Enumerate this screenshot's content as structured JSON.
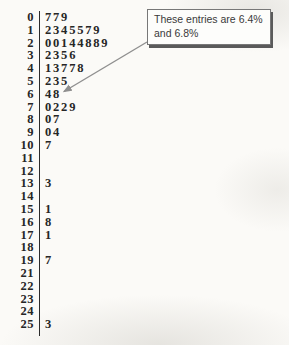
{
  "chart_data": {
    "type": "table",
    "subtype": "stem-and-leaf-plot",
    "title": "",
    "columns": [
      "stem",
      "leaves"
    ],
    "rows": [
      {
        "stem": "0",
        "leaf": "779"
      },
      {
        "stem": "1",
        "leaf": "2345579"
      },
      {
        "stem": "2",
        "leaf": "00144889"
      },
      {
        "stem": "3",
        "leaf": "2356"
      },
      {
        "stem": "4",
        "leaf": "13778"
      },
      {
        "stem": "5",
        "leaf": "235"
      },
      {
        "stem": "6",
        "leaf": "48"
      },
      {
        "stem": "7",
        "leaf": "0229"
      },
      {
        "stem": "8",
        "leaf": "07"
      },
      {
        "stem": "9",
        "leaf": "04"
      },
      {
        "stem": "10",
        "leaf": "7"
      },
      {
        "stem": "11",
        "leaf": ""
      },
      {
        "stem": "12",
        "leaf": ""
      },
      {
        "stem": "13",
        "leaf": "3"
      },
      {
        "stem": "14",
        "leaf": ""
      },
      {
        "stem": "15",
        "leaf": "1"
      },
      {
        "stem": "16",
        "leaf": "8"
      },
      {
        "stem": "17",
        "leaf": "1"
      },
      {
        "stem": "18",
        "leaf": ""
      },
      {
        "stem": "19",
        "leaf": "7"
      },
      {
        "stem": "21",
        "leaf": ""
      },
      {
        "stem": "22",
        "leaf": ""
      },
      {
        "stem": "23",
        "leaf": ""
      },
      {
        "stem": "24",
        "leaf": ""
      },
      {
        "stem": "25",
        "leaf": "3"
      }
    ],
    "annotations": [
      {
        "text": "These entries are 6.4% and 6.8%",
        "target": "stem 6 leaves 4 and 8"
      }
    ],
    "legend_position": "none",
    "grid": false
  },
  "callout": {
    "line1": "These entries are 6.4%",
    "line2": "and 6.8%"
  },
  "colors": {
    "text": "#262626",
    "divider": "#2b2b2b",
    "arrow": "#8f8f8f",
    "callout_border": "#777777",
    "callout_shadow": "#5a5a5a",
    "callout_text": "#3a3a3a"
  }
}
